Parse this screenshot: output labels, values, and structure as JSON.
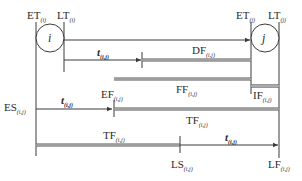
{
  "diagram": {
    "nodes": [
      {
        "id": "i",
        "label": "i",
        "et_label": "ET",
        "et_sub": "(i)",
        "lt_label": "LT",
        "lt_sub": "(i)"
      },
      {
        "id": "j",
        "label": "j",
        "et_label": "ET",
        "et_sub": "(j)",
        "lt_label": "LT",
        "lt_sub": "(j)"
      }
    ],
    "activity": {
      "duration_label": "t",
      "duration_sub": "(i,j)"
    },
    "labels": {
      "df": {
        "main": "DF",
        "sub": "(i,j)"
      },
      "ff": {
        "main": "FF",
        "sub": "(i,j)"
      },
      "if": {
        "main": "IF",
        "sub": "(i,j)"
      },
      "es": {
        "main": "ES",
        "sub": "(i,j)"
      },
      "ef": {
        "main": "EF",
        "sub": "(i,j)"
      },
      "tf_upper": {
        "main": "TF",
        "sub": "(i,j)"
      },
      "tf_lower": {
        "main": "TF",
        "sub": "(i,j)"
      },
      "ls": {
        "main": "LS",
        "sub": "(i,j)"
      },
      "lf": {
        "main": "LF",
        "sub": "(i,j)"
      }
    },
    "colors": {
      "line": "#3a3a3a",
      "background": "#ffffff"
    }
  }
}
